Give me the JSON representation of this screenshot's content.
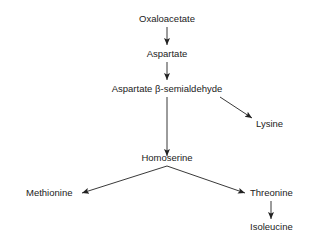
{
  "diagram": {
    "type": "metabolic-pathway",
    "nodes": {
      "oxaloacetate": "Oxaloacetate",
      "aspartate": "Aspartate",
      "aspartate_semialdehyde": "Aspartate β-semialdehyde",
      "lysine": "Lysine",
      "homoserine": "Homoserine",
      "methionine": "Methionine",
      "threonine": "Threonine",
      "isoleucine": "Isoleucine"
    },
    "edges": [
      {
        "from": "Oxaloacetate",
        "to": "Aspartate"
      },
      {
        "from": "Aspartate",
        "to": "Aspartate β-semialdehyde"
      },
      {
        "from": "Aspartate β-semialdehyde",
        "to": "Lysine"
      },
      {
        "from": "Aspartate β-semialdehyde",
        "to": "Homoserine"
      },
      {
        "from": "Homoserine",
        "to": "Methionine"
      },
      {
        "from": "Homoserine",
        "to": "Threonine"
      },
      {
        "from": "Threonine",
        "to": "Isoleucine"
      }
    ],
    "colors": {
      "text": "#222222",
      "line": "#222222",
      "background": "#ffffff"
    }
  }
}
